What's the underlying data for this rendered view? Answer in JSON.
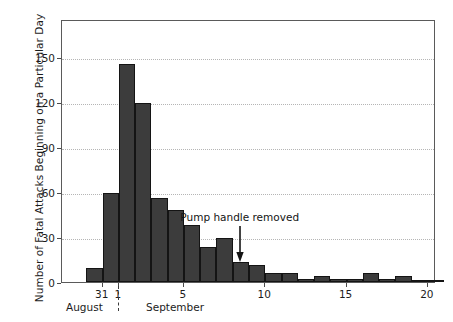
{
  "chart_data": {
    "type": "bar",
    "title": "",
    "subtitle": "",
    "xlabel": "",
    "ylabel": "Number of Fatal Attacks Beginning on a Particular Day",
    "ylim": [
      0,
      175
    ],
    "yticks": [
      0,
      30,
      60,
      90,
      120,
      150
    ],
    "ytick_labels": [
      "0",
      "30",
      "60",
      "90",
      "120",
      "150"
    ],
    "xlim": [
      28.5,
      51.5
    ],
    "xticks": [
      31,
      32,
      36,
      41,
      46,
      51
    ],
    "xtick_labels": [
      "31",
      "1",
      "5",
      "10",
      "15",
      "20"
    ],
    "grid": true,
    "legend": false,
    "bar_color": "#3c3c3c",
    "bar_edge_color": "#141414",
    "categories": [
      "Aug 30",
      "Aug 31",
      "Sep 1",
      "Sep 2",
      "Sep 3",
      "Sep 4",
      "Sep 5",
      "Sep 6",
      "Sep 7",
      "Sep 8",
      "Sep 9",
      "Sep 10",
      "Sep 11",
      "Sep 12",
      "Sep 13",
      "Sep 14",
      "Sep 15",
      "Sep 16",
      "Sep 17",
      "Sep 18",
      "Sep 19",
      "Sep 20"
    ],
    "values": [
      9,
      59,
      145,
      119,
      56,
      48,
      38,
      23,
      29,
      13,
      11,
      6,
      6,
      2,
      4,
      2,
      2,
      6,
      2,
      4,
      1,
      1
    ],
    "annotations": [
      {
        "text": "Pump handle removed",
        "x_day": "Sep 8",
        "arrow": "down",
        "arrow_tip_value": 14
      }
    ],
    "axis_group_labels": [
      {
        "label": "August",
        "span": "Aug 30 - Aug 31"
      },
      {
        "label": "September",
        "span": "Sep 1 - Sep 20"
      }
    ],
    "month_divider": true
  }
}
